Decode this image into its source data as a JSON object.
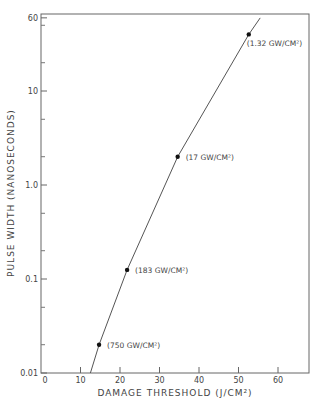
{
  "chart_data": {
    "type": "line",
    "title": "",
    "xlabel": "DAMAGE THRESHOLD (J/CM²)",
    "ylabel": "PULSE WIDTH (NANOSECONDS)",
    "xscale": "linear",
    "yscale": "log",
    "xlim": [
      0,
      67
    ],
    "ylim": [
      0.01,
      60
    ],
    "x_ticks": [
      0,
      10,
      20,
      30,
      40,
      50,
      60
    ],
    "x_tick_labels": [
      "0",
      "10",
      "20",
      "30",
      "40",
      "50",
      "60"
    ],
    "y_ticks": [
      0.01,
      0.1,
      1.0,
      10,
      60
    ],
    "y_tick_labels": [
      "0.01",
      "0.1",
      "1.0",
      "10",
      "60"
    ],
    "grid": false,
    "legend": null,
    "series": [
      {
        "name": "measured points",
        "x": [
          14.7,
          21.8,
          34.6,
          52.6
        ],
        "y": [
          0.02,
          0.125,
          2.0,
          40
        ],
        "annotations": [
          "(750 GW/CM²)",
          "(183 GW/CM²)",
          "(17 GW/CM²)",
          "(1.32 GW/CM²)"
        ]
      },
      {
        "name": "fit curve",
        "x": [
          12.5,
          14.7,
          21.8,
          34.6,
          52.6,
          55.5
        ],
        "y": [
          0.01,
          0.02,
          0.125,
          2.0,
          40,
          60
        ]
      }
    ]
  },
  "labels": {
    "xlabel": "DAMAGE THRESHOLD",
    "xlabel_unit": "(J/CM",
    "ylabel": "PULSE  WIDTH  (NANOSECONDS)"
  }
}
